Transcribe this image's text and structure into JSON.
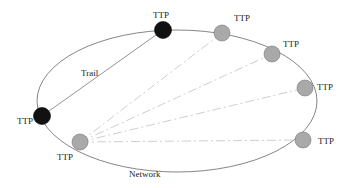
{
  "diagram": {
    "network_label": "Network",
    "trail_label": "Trail",
    "node_label": "TTP",
    "colors": {
      "ring": "#666666",
      "trail": "#777777",
      "dashed": "#c8c8c8",
      "black_node": "#111111",
      "gray_node": "#a9a9a9",
      "gray_node_stroke": "#777777"
    },
    "nodes": [
      {
        "id": "n1",
        "type": "black",
        "x": 163,
        "y": 30,
        "label": "TTP",
        "lx": 153,
        "ly": 12
      },
      {
        "id": "n2",
        "type": "gray",
        "x": 222,
        "y": 33,
        "label": "TTP",
        "lx": 234,
        "ly": 20
      },
      {
        "id": "n3",
        "type": "gray",
        "x": 272,
        "y": 54,
        "label": "TTP",
        "lx": 283,
        "ly": 40
      },
      {
        "id": "n4",
        "type": "gray",
        "x": 305,
        "y": 88,
        "label": "TTP",
        "lx": 316,
        "ly": 84
      },
      {
        "id": "n5",
        "type": "gray",
        "x": 303,
        "y": 140,
        "label": "TTP",
        "lx": 318,
        "ly": 142
      },
      {
        "id": "n6",
        "type": "gray",
        "x": 80,
        "y": 142,
        "label": "TTP",
        "lx": 56,
        "ly": 154
      },
      {
        "id": "n7",
        "type": "black",
        "x": 42,
        "y": 116,
        "label": "TTP",
        "lx": 17,
        "ly": 117
      }
    ],
    "trail": {
      "from": "n1",
      "to": "n7"
    },
    "dashed_links": [
      {
        "from": "n6",
        "to": "n2"
      },
      {
        "from": "n6",
        "to": "n3"
      },
      {
        "from": "n6",
        "to": "n4"
      },
      {
        "from": "n6",
        "to": "n5"
      }
    ]
  }
}
